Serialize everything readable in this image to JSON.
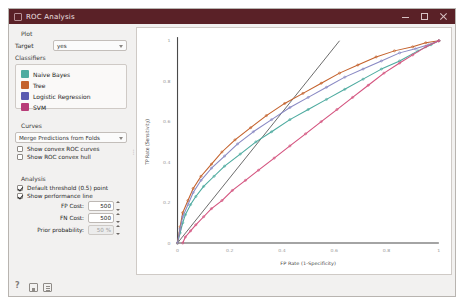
{
  "window": {
    "title": "ROC Analysis",
    "icon": "window-icon",
    "minimize": "minimize-icon",
    "maximize": "maximize-icon",
    "close": "close-icon",
    "titlebar_color": "#5a2127"
  },
  "sidebar": {
    "plot_group": {
      "title": "Plot",
      "target_label": "Target",
      "target_value": "yes",
      "classifiers_label": "Classifiers",
      "classifiers": [
        {
          "label": "Naive Bayes",
          "color": "#4eaba0"
        },
        {
          "label": "Tree",
          "color": "#c4622d"
        },
        {
          "label": "Logistic Regression",
          "color": "#5a5ab0"
        },
        {
          "label": "SVM",
          "color": "#b83c78"
        }
      ]
    },
    "curves_group": {
      "title": "Curves",
      "merge_value": "Merge Predictions from Folds",
      "checkboxes": [
        {
          "label": "Show convex ROC curves",
          "checked": false
        },
        {
          "label": "Show ROC convex hull",
          "checked": false
        }
      ]
    },
    "analysis_group": {
      "title": "Analysis",
      "checkboxes": [
        {
          "label": "Default threshold (0.5) point",
          "checked": true
        },
        {
          "label": "Show performance line",
          "checked": true
        }
      ],
      "spinners": [
        {
          "label": "FP Cost:",
          "value": "500",
          "disabled": false
        },
        {
          "label": "FN Cost:",
          "value": "500",
          "disabled": false
        },
        {
          "label": "Prior probability:",
          "value": "50 %",
          "disabled": true
        }
      ]
    }
  },
  "statusbar": {
    "icons": [
      "help-icon",
      "save-icon",
      "report-icon"
    ]
  },
  "chart_data": {
    "type": "line",
    "title": "",
    "xlabel": "FP Rate (1-Specificity)",
    "ylabel": "TP Rate (Sensitivity)",
    "xlim": [
      0,
      1
    ],
    "ylim": [
      0,
      1
    ],
    "xticks": [
      "0",
      "0.2",
      "0.4",
      "0.6",
      "0.8",
      "1"
    ],
    "yticks": [
      "0",
      "0.2",
      "0.4",
      "0.6",
      "0.8",
      "1"
    ],
    "grid": false,
    "legend": "in-sidebar",
    "annotations": [
      {
        "name": "performance-line",
        "type": "line",
        "x": [
          0.0,
          0.62
        ],
        "y": [
          0.0,
          1.0
        ],
        "color": "#555555"
      }
    ],
    "series": [
      {
        "name": "Naive Bayes",
        "color": "#4eaba0",
        "x": [
          0.0,
          0.01,
          0.02,
          0.03,
          0.05,
          0.07,
          0.1,
          0.14,
          0.18,
          0.24,
          0.3,
          0.36,
          0.43,
          0.5,
          0.57,
          0.64,
          0.71,
          0.78,
          0.85,
          0.92,
          0.97,
          1.0
        ],
        "y": [
          0.0,
          0.05,
          0.1,
          0.14,
          0.19,
          0.23,
          0.28,
          0.33,
          0.38,
          0.44,
          0.5,
          0.55,
          0.61,
          0.66,
          0.71,
          0.76,
          0.81,
          0.86,
          0.9,
          0.95,
          0.98,
          1.0
        ]
      },
      {
        "name": "Tree",
        "color": "#c4622d",
        "x": [
          0.0,
          0.01,
          0.02,
          0.04,
          0.06,
          0.09,
          0.13,
          0.17,
          0.22,
          0.28,
          0.34,
          0.41,
          0.48,
          0.55,
          0.62,
          0.69,
          0.76,
          0.83,
          0.9,
          0.95,
          1.0
        ],
        "y": [
          0.0,
          0.08,
          0.15,
          0.21,
          0.27,
          0.33,
          0.39,
          0.45,
          0.51,
          0.57,
          0.63,
          0.69,
          0.74,
          0.79,
          0.84,
          0.88,
          0.92,
          0.95,
          0.97,
          0.99,
          1.0
        ]
      },
      {
        "name": "Logistic Regression",
        "color": "#8a8ac4",
        "x": [
          0.0,
          0.01,
          0.02,
          0.04,
          0.06,
          0.09,
          0.13,
          0.18,
          0.23,
          0.29,
          0.36,
          0.43,
          0.5,
          0.57,
          0.64,
          0.71,
          0.78,
          0.85,
          0.91,
          0.96,
          1.0
        ],
        "y": [
          0.0,
          0.07,
          0.13,
          0.19,
          0.25,
          0.31,
          0.37,
          0.43,
          0.49,
          0.55,
          0.61,
          0.67,
          0.72,
          0.77,
          0.82,
          0.86,
          0.9,
          0.94,
          0.96,
          0.98,
          1.0
        ]
      },
      {
        "name": "SVM",
        "color": "#d4547f",
        "x": [
          0.02,
          0.03,
          0.05,
          0.07,
          0.1,
          0.13,
          0.17,
          0.21,
          0.26,
          0.31,
          0.37,
          0.43,
          0.49,
          0.55,
          0.61,
          0.67,
          0.73,
          0.79,
          0.85,
          0.9,
          0.95,
          1.0
        ],
        "y": [
          0.0,
          0.03,
          0.06,
          0.09,
          0.13,
          0.17,
          0.21,
          0.26,
          0.31,
          0.36,
          0.42,
          0.48,
          0.54,
          0.6,
          0.66,
          0.72,
          0.78,
          0.84,
          0.89,
          0.93,
          0.97,
          1.0
        ]
      }
    ]
  }
}
